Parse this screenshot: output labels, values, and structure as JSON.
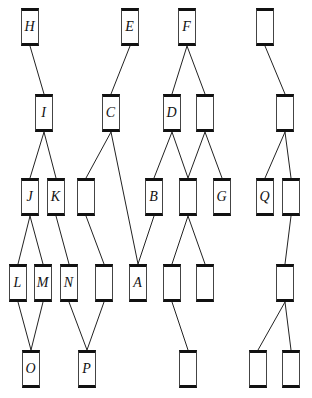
{
  "diagram": {
    "type": "hierarchy-graph",
    "node_size": {
      "w": 19,
      "h": 38
    },
    "nodes": [
      {
        "id": "H",
        "label": "H",
        "x": 30,
        "y": 8
      },
      {
        "id": "E",
        "label": "E",
        "x": 130,
        "y": 8
      },
      {
        "id": "F",
        "label": "F",
        "x": 187,
        "y": 8
      },
      {
        "id": "u1",
        "label": "",
        "x": 265,
        "y": 8
      },
      {
        "id": "I",
        "label": "I",
        "x": 44,
        "y": 94
      },
      {
        "id": "C",
        "label": "C",
        "x": 111,
        "y": 94
      },
      {
        "id": "D",
        "label": "D",
        "x": 172,
        "y": 94
      },
      {
        "id": "u2a",
        "label": "",
        "x": 205,
        "y": 94
      },
      {
        "id": "u2b",
        "label": "",
        "x": 285,
        "y": 94
      },
      {
        "id": "J",
        "label": "J",
        "x": 30,
        "y": 178
      },
      {
        "id": "K",
        "label": "K",
        "x": 56,
        "y": 178
      },
      {
        "id": "u3a",
        "label": "",
        "x": 86,
        "y": 178
      },
      {
        "id": "B",
        "label": "B",
        "x": 154,
        "y": 178
      },
      {
        "id": "u3b",
        "label": "",
        "x": 188,
        "y": 178
      },
      {
        "id": "G",
        "label": "G",
        "x": 222,
        "y": 178
      },
      {
        "id": "Q",
        "label": "Q",
        "x": 265,
        "y": 178
      },
      {
        "id": "u3c",
        "label": "",
        "x": 291,
        "y": 178
      },
      {
        "id": "L",
        "label": "L",
        "x": 18,
        "y": 264
      },
      {
        "id": "M",
        "label": "M",
        "x": 43,
        "y": 264
      },
      {
        "id": "N",
        "label": "N",
        "x": 69,
        "y": 264
      },
      {
        "id": "u4a",
        "label": "",
        "x": 104,
        "y": 264
      },
      {
        "id": "A",
        "label": "A",
        "x": 138,
        "y": 264
      },
      {
        "id": "u4b",
        "label": "",
        "x": 172,
        "y": 264
      },
      {
        "id": "u4c",
        "label": "",
        "x": 205,
        "y": 264
      },
      {
        "id": "u4d",
        "label": "",
        "x": 285,
        "y": 264
      },
      {
        "id": "O",
        "label": "O",
        "x": 31,
        "y": 350
      },
      {
        "id": "P",
        "label": "P",
        "x": 87,
        "y": 350
      },
      {
        "id": "u5a",
        "label": "",
        "x": 188,
        "y": 350
      },
      {
        "id": "u5b",
        "label": "",
        "x": 258,
        "y": 350
      },
      {
        "id": "u5c",
        "label": "",
        "x": 291,
        "y": 350
      }
    ],
    "edges": [
      [
        "H",
        "I"
      ],
      [
        "I",
        "J"
      ],
      [
        "I",
        "K"
      ],
      [
        "E",
        "C"
      ],
      [
        "C",
        "u3a"
      ],
      [
        "C",
        "A"
      ],
      [
        "F",
        "D"
      ],
      [
        "F",
        "u2a"
      ],
      [
        "D",
        "B"
      ],
      [
        "D",
        "u3b"
      ],
      [
        "u2a",
        "u3b"
      ],
      [
        "u2a",
        "G"
      ],
      [
        "u1",
        "u2b"
      ],
      [
        "u2b",
        "Q"
      ],
      [
        "u2b",
        "u3c"
      ],
      [
        "J",
        "L"
      ],
      [
        "J",
        "M"
      ],
      [
        "K",
        "N"
      ],
      [
        "u3a",
        "u4a"
      ],
      [
        "B",
        "A"
      ],
      [
        "u3b",
        "u4b"
      ],
      [
        "u3b",
        "u4c"
      ],
      [
        "u3c",
        "u4d"
      ],
      [
        "L",
        "O"
      ],
      [
        "M",
        "O"
      ],
      [
        "N",
        "P"
      ],
      [
        "u4a",
        "P"
      ],
      [
        "u4b",
        "u5a"
      ],
      [
        "u4d",
        "u5b"
      ],
      [
        "u4d",
        "u5c"
      ]
    ]
  }
}
